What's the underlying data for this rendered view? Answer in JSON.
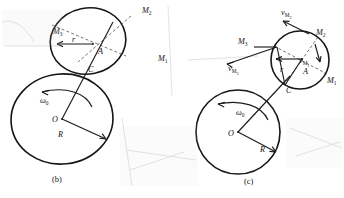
{
  "figure": {
    "type": "mechanics-diagram",
    "panels": [
      {
        "caption": "(b)",
        "caption_x": 56,
        "caption_y": 181,
        "large_circle": {
          "center_label": "O",
          "radius_label": "R",
          "angular_velocity_label": "ω",
          "angular_velocity_sub": "0",
          "cx": 62,
          "cy": 119,
          "rx": 51,
          "ry": 45
        },
        "small_circle": {
          "center_label": "A",
          "radius_label": "r",
          "contact_label": "C",
          "cx": 88,
          "cy": 41,
          "rx": 38,
          "ry": 33
        },
        "point_labels": [
          {
            "name": "M",
            "sub": "1",
            "x": 160,
            "y": 58
          },
          {
            "name": "M",
            "sub": "2",
            "x": 146,
            "y": 12
          },
          {
            "name": "M",
            "sub": "3",
            "x": 57,
            "y": 33
          }
        ]
      },
      {
        "caption": "(c)",
        "caption_x": 246,
        "caption_y": 183,
        "large_circle": {
          "center_label": "O",
          "radius_label": "R",
          "angular_velocity_label": "ω",
          "angular_velocity_sub": "0",
          "cx": 238,
          "cy": 132,
          "rx": 42,
          "ry": 42
        },
        "small_circle": {
          "center_label": "A",
          "radius_label": "r",
          "contact_label": "C",
          "cx": 300,
          "cy": 60,
          "rx": 29,
          "ry": 29
        },
        "point_labels": [
          {
            "name": "M",
            "sub": "1",
            "x": 328,
            "y": 80
          },
          {
            "name": "M",
            "sub": "2",
            "x": 318,
            "y": 33
          },
          {
            "name": "M",
            "sub": "3",
            "x": 241,
            "y": 43
          }
        ],
        "velocity_labels": [
          {
            "name": "v",
            "sub": "M",
            "sub2": "2",
            "x": 284,
            "y": 14
          },
          {
            "name": "v",
            "sub": "M",
            "sub2": "3",
            "x": 231,
            "y": 70
          },
          {
            "name": "v",
            "sub": "M",
            "sub2": "1",
            "x": 301,
            "y": 62
          }
        ]
      }
    ]
  }
}
